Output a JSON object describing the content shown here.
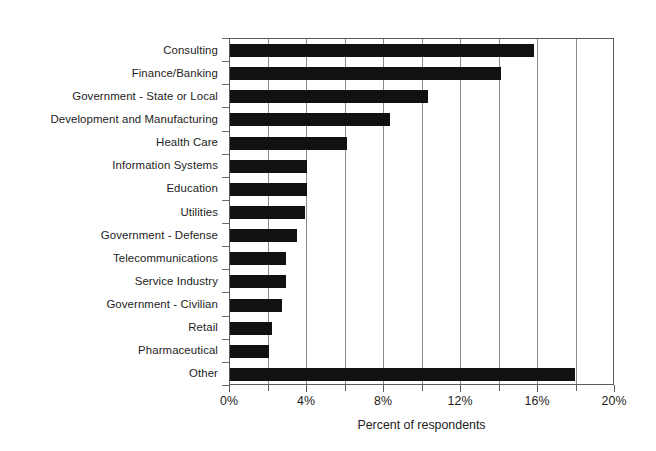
{
  "chart_data": {
    "type": "bar",
    "orientation": "horizontal",
    "title": "",
    "xlabel": "Percent of respondents",
    "ylabel": "",
    "xlim": [
      0,
      20
    ],
    "xtick_labels": [
      "0%",
      "4%",
      "8%",
      "12%",
      "16%",
      "20%"
    ],
    "xtick_values": [
      0,
      4,
      8,
      12,
      16,
      20
    ],
    "minor_tick_values": [
      2,
      6,
      10,
      14,
      18
    ],
    "gridlines": [
      2,
      4,
      6,
      8,
      10,
      12,
      14,
      16,
      18
    ],
    "grid": true,
    "legend": null,
    "bar_color": "#111111",
    "categories": [
      "Consulting",
      "Finance/Banking",
      "Government - State or Local",
      "Development and Manufacturing",
      "Health Care",
      "Information Systems",
      "Education",
      "Utilities",
      "Government - Defense",
      "Telecommunications",
      "Service Industry",
      "Government - Civilian",
      "Retail",
      "Pharmaceutical",
      "Other"
    ],
    "values": [
      15.8,
      14.1,
      10.3,
      8.3,
      6.1,
      4.0,
      4.0,
      3.9,
      3.5,
      2.9,
      2.9,
      2.7,
      2.2,
      2.0,
      17.9
    ],
    "value_unit": "%"
  }
}
